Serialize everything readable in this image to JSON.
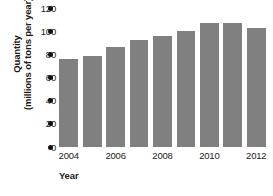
{
  "chart_data": {
    "type": "bar",
    "title": "",
    "subtitle": "",
    "xlabel": "Year",
    "ylabel": "Quantity (millions of tons per year)",
    "ylabel_line1": "Quantity",
    "ylabel_line2": "(millions of tons per year)",
    "categories": [
      "2004",
      "2005",
      "2006",
      "2007",
      "2008",
      "2009",
      "2010",
      "2011",
      "2012"
    ],
    "values": [
      76,
      79,
      86,
      92,
      96,
      100,
      107,
      107,
      103
    ],
    "series": [
      {
        "name": "Quantity",
        "values": [
          76,
          79,
          86,
          92,
          96,
          100,
          107,
          107,
          103
        ]
      }
    ],
    "ylim": [
      0,
      120
    ],
    "xlim_categories": 9,
    "y_ticks": [
      0,
      20,
      40,
      60,
      80,
      100,
      120
    ],
    "y_tick_labels": [
      "0",
      "20",
      "40",
      "60",
      "80",
      "100",
      "120"
    ],
    "x_tick_labels": [
      "2004",
      "2006",
      "2008",
      "2010",
      "2012"
    ],
    "x_tick_category_indices": [
      0,
      2,
      4,
      6,
      8
    ],
    "grid": false,
    "legend": false,
    "legend_position": "none",
    "bar_color": "#808080",
    "tick_marker_color": "#111111",
    "text_color": "#232323",
    "background_color": "#ffffff",
    "tick_marker_style": "dot"
  }
}
